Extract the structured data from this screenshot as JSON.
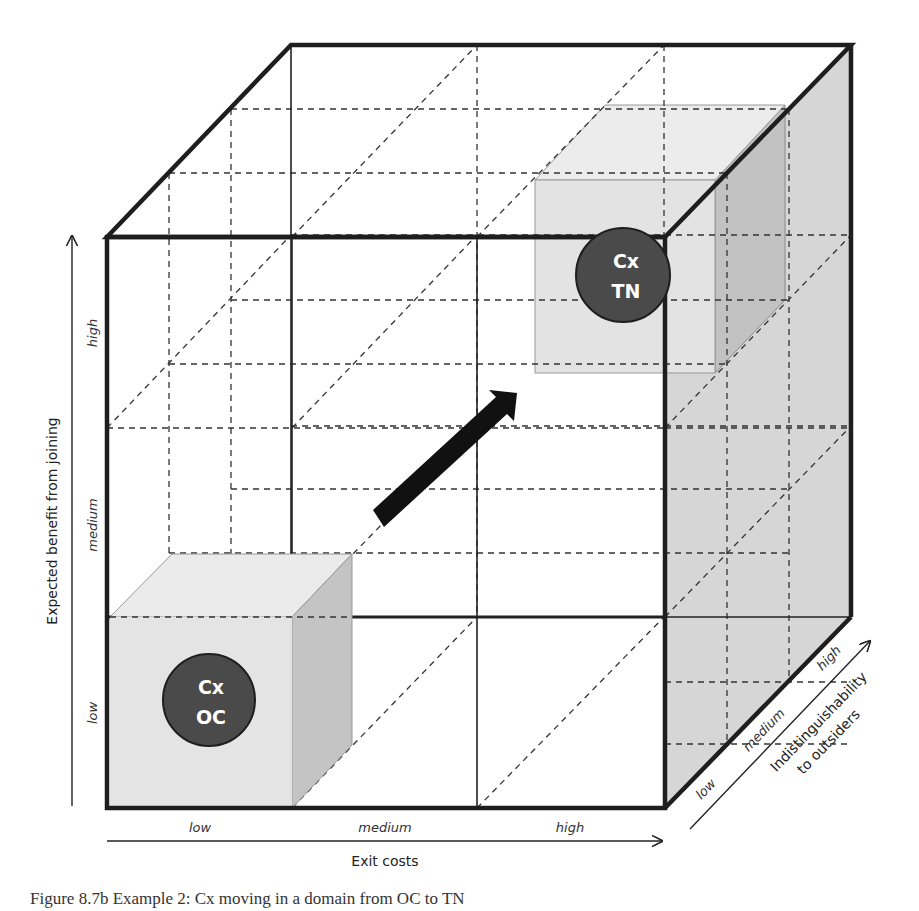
{
  "figure": {
    "caption": "Figure 8.7b Example 2: Cx moving in a domain from OC to TN",
    "axes": {
      "x": {
        "title": "Exit costs",
        "ticks": [
          "low",
          "medium",
          "high"
        ]
      },
      "y": {
        "title": "Expected benefit from joining",
        "ticks": [
          "low",
          "medium",
          "high"
        ]
      },
      "z": {
        "title_line1": "Indistinguishability",
        "title_line2": "to outsiders",
        "ticks": [
          "low",
          "medium",
          "high"
        ]
      }
    },
    "nodes": {
      "start": {
        "line1": "Cx",
        "line2": "OC",
        "position": {
          "x": "low",
          "y": "low",
          "z": "low"
        }
      },
      "end": {
        "line1": "Cx",
        "line2": "TN",
        "position": {
          "x": "high",
          "y": "high",
          "z": "high"
        }
      }
    },
    "movement_arrow": {
      "from": "OC",
      "to": "TN"
    }
  },
  "colors": {
    "edge": "#1e1e1e",
    "circle_fill": "#4a4a4a",
    "circle_text": "#ffffff",
    "cell_front": "#e4e4e4",
    "cell_top": "#ebebeb",
    "cell_side": "#c4c4c4",
    "right_face": "#d4d4d4",
    "background": "#ffffff"
  }
}
